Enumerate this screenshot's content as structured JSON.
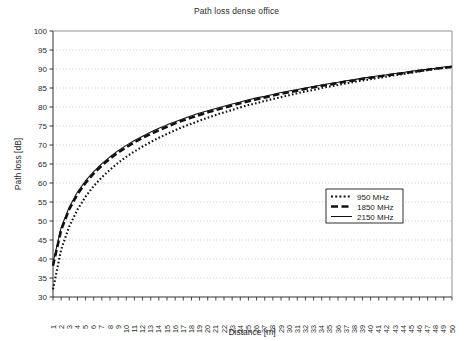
{
  "chart_data": {
    "type": "line",
    "title": "Path loss dense office",
    "xlabel": "Distance [m]",
    "ylabel": "Path loss [dB]",
    "xlim": [
      1,
      50
    ],
    "ylim": [
      30,
      100
    ],
    "yticks": [
      30,
      35,
      40,
      45,
      50,
      55,
      60,
      65,
      70,
      75,
      80,
      85,
      90,
      95,
      100
    ],
    "grid": "horizontal-dotted",
    "legend_position": "center-right",
    "x": [
      1,
      2,
      3,
      4,
      5,
      6,
      7,
      8,
      9,
      10,
      11,
      12,
      13,
      14,
      15,
      16,
      17,
      18,
      19,
      20,
      21,
      22,
      23,
      24,
      25,
      26,
      27,
      28,
      29,
      30,
      31,
      32,
      33,
      34,
      35,
      36,
      37,
      38,
      39,
      40,
      41,
      42,
      43,
      44,
      45,
      46,
      47,
      48,
      49,
      50
    ],
    "xtick_labels": [
      "1",
      "2",
      "3",
      "4",
      "5",
      "6",
      "7",
      "8",
      "9",
      "10",
      "11",
      "12",
      "13",
      "14",
      "15",
      "16",
      "17",
      "18",
      "19",
      "20",
      "21",
      "22",
      "23",
      "24",
      "25",
      "26",
      "27",
      "28",
      "29",
      "30",
      "31",
      "32",
      "33",
      "34",
      "35",
      "36",
      "37",
      "38",
      "39",
      "40",
      "41",
      "42",
      "43",
      "44",
      "45",
      "46",
      "47",
      "48",
      "49",
      "50"
    ],
    "series": [
      {
        "name": "950 MHz",
        "style": "dotted",
        "color": "#111111",
        "values": [
          32.0,
          42.5,
          48.6,
          53.0,
          56.4,
          59.2,
          61.5,
          63.5,
          65.3,
          66.9,
          68.3,
          69.6,
          70.8,
          71.9,
          72.9,
          73.9,
          74.8,
          75.6,
          76.4,
          77.2,
          77.9,
          78.6,
          79.2,
          79.9,
          80.5,
          81.0,
          81.6,
          82.1,
          82.6,
          83.1,
          83.6,
          84.1,
          84.5,
          85.0,
          85.4,
          85.8,
          86.2,
          86.6,
          87.0,
          87.3,
          87.7,
          88.0,
          88.4,
          88.7,
          89.0,
          89.4,
          89.7,
          90.0,
          90.3,
          90.5
        ]
      },
      {
        "name": "1850 MHz",
        "style": "dashed",
        "color": "#111111",
        "values": [
          38.2,
          47.6,
          53.1,
          57.0,
          60.0,
          62.5,
          64.6,
          66.4,
          68.0,
          69.4,
          70.7,
          71.9,
          72.9,
          73.9,
          74.8,
          75.7,
          76.5,
          77.2,
          77.9,
          78.6,
          79.2,
          79.8,
          80.4,
          81.0,
          81.5,
          82.0,
          82.5,
          83.0,
          83.5,
          83.9,
          84.3,
          84.8,
          85.2,
          85.6,
          85.9,
          86.3,
          86.7,
          87.0,
          87.4,
          87.7,
          88.0,
          88.3,
          88.6,
          88.9,
          89.2,
          89.5,
          89.8,
          90.1,
          90.3,
          90.6
        ]
      },
      {
        "name": "2150 MHz",
        "style": "solid",
        "color": "#111111",
        "values": [
          39.0,
          48.3,
          53.7,
          57.6,
          60.6,
          63.0,
          65.1,
          66.9,
          68.5,
          69.9,
          71.2,
          72.3,
          73.4,
          74.4,
          75.3,
          76.1,
          76.9,
          77.7,
          78.4,
          79.0,
          79.6,
          80.2,
          80.8,
          81.3,
          81.9,
          82.4,
          82.8,
          83.3,
          83.8,
          84.2,
          84.6,
          85.0,
          85.4,
          85.8,
          86.2,
          86.5,
          86.9,
          87.2,
          87.6,
          87.9,
          88.2,
          88.5,
          88.8,
          89.1,
          89.4,
          89.7,
          89.9,
          90.2,
          90.5,
          90.7
        ]
      }
    ]
  },
  "legend": {
    "entries": [
      {
        "label": "950 MHz"
      },
      {
        "label": "1850 MHz"
      },
      {
        "label": "2150 MHz"
      }
    ]
  }
}
